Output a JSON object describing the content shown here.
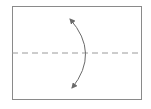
{
  "diagram": {
    "title": "Valley fold in half (bottom to top)",
    "paper": {
      "x": 12,
      "y": 6,
      "width": 130,
      "height": 94,
      "stroke": "#8a8a8a",
      "fill": "#ffffff"
    },
    "fold_line": {
      "type": "valley-fold",
      "style": "dashed",
      "y": 53,
      "x1": 12,
      "x2": 142,
      "color": "#9a9a9a",
      "dash": "6 4"
    },
    "arrow": {
      "type": "double-headed-curved",
      "start": [
        70,
        19
      ],
      "control": [
        95,
        53
      ],
      "end": [
        72,
        88
      ],
      "color": "#6a6a6a"
    }
  }
}
